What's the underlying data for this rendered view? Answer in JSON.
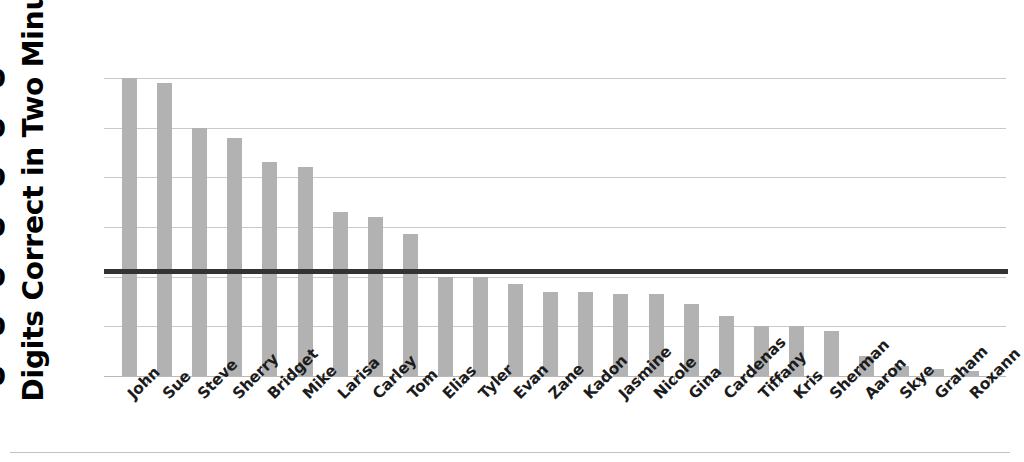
{
  "chart_data": {
    "type": "bar",
    "title": "",
    "xlabel": "",
    "ylabel": "Digits Correct in Two Minutes",
    "ylim": [
      0,
      62
    ],
    "yticks": [
      0,
      10,
      20,
      30,
      40,
      50,
      60
    ],
    "ytick_labels": [
      "0",
      "10",
      "20",
      "30",
      "40",
      "50",
      "60"
    ],
    "grid": "horizontal",
    "legend": "none",
    "bar_color": "#b2b2b2",
    "reference_line": {
      "label": "mean",
      "value": 21.2,
      "color": "#333333",
      "orientation": "horizontal"
    },
    "categories": [
      "John",
      "Sue",
      "Steve",
      "Sherry",
      "Bridget",
      "Mike",
      "Larisa",
      "Carley",
      "Tom",
      "Elias",
      "Tyler",
      "Evan",
      "Zane",
      "Kadon",
      "Jasmine",
      "Nicole",
      "Gina",
      "Cardenas",
      "Tiffany",
      "Kris",
      "Sherman",
      "Aaron",
      "Skye",
      "Graham",
      "Roxann"
    ],
    "values": [
      60,
      59,
      50,
      48,
      43,
      42,
      33,
      32,
      28.5,
      20,
      20,
      18.5,
      17,
      17,
      16.5,
      16.5,
      14.5,
      12,
      10,
      10,
      9,
      4,
      2,
      1.5,
      1
    ]
  }
}
